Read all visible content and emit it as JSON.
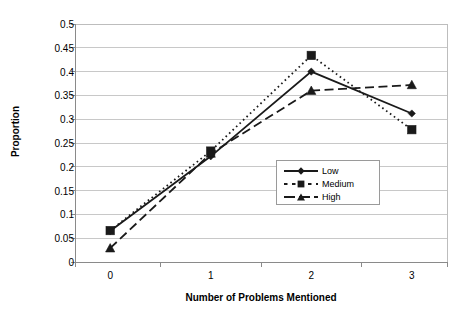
{
  "chart_data": {
    "type": "line",
    "title": "",
    "xlabel": "Number of Problems Mentioned",
    "ylabel": "Proportion",
    "categories": [
      "0",
      "1",
      "2",
      "3"
    ],
    "x": [
      0,
      1,
      2,
      3
    ],
    "xlim": [
      -0.35,
      3.35
    ],
    "ylim": [
      0,
      0.5
    ],
    "ytick_labels": [
      "0",
      "0.05",
      "0.1",
      "0.15",
      "0.2",
      "0.25",
      "0.3",
      "0.35",
      "0.4",
      "0.45",
      "0.5"
    ],
    "ytick_values": [
      0,
      0.05,
      0.1,
      0.15,
      0.2,
      0.25,
      0.3,
      0.35,
      0.4,
      0.45,
      0.5
    ],
    "grid": "horizontal",
    "legend_position": "center-right-inside",
    "series": [
      {
        "name": "Low",
        "values": [
          0.065,
          0.222,
          0.4,
          0.312
        ],
        "line_style": "solid",
        "marker": "diamond",
        "color": "#1a1a1a"
      },
      {
        "name": "Medium",
        "values": [
          0.066,
          0.233,
          0.434,
          0.278
        ],
        "line_style": "dotted",
        "marker": "square",
        "color": "#1a1a1a"
      },
      {
        "name": "High",
        "values": [
          0.029,
          0.228,
          0.36,
          0.372
        ],
        "line_style": "dashed",
        "marker": "triangle",
        "color": "#1a1a1a"
      }
    ]
  },
  "legend": {
    "items": [
      {
        "label": "Low"
      },
      {
        "label": "Medium"
      },
      {
        "label": "High"
      }
    ]
  },
  "axes": {
    "y_title": "Proportion",
    "x_title": "Number of Problems Mentioned"
  },
  "colors": {
    "ink": "#1a1a1a",
    "grid": "#c8c8c8",
    "axis": "#8a8a8a",
    "background": "#ffffff"
  }
}
